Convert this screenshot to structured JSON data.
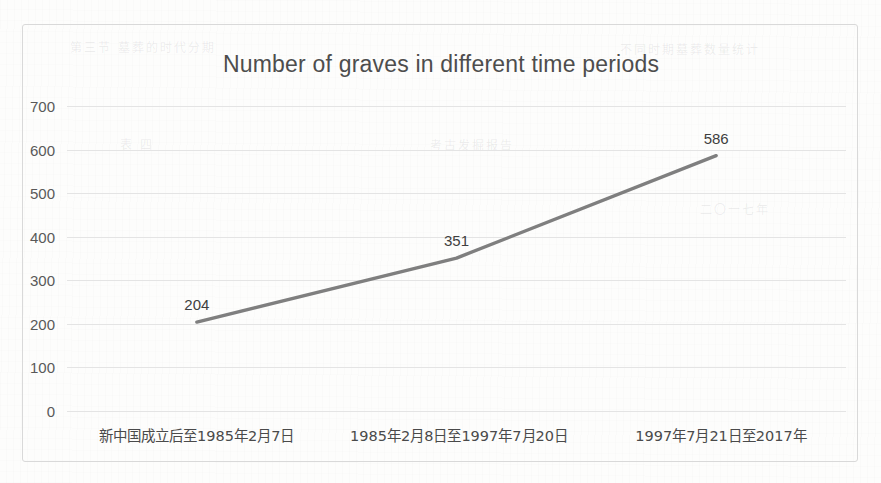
{
  "chart_data": {
    "type": "line",
    "title": "Number of graves in different time periods",
    "xlabel": "",
    "ylabel": "",
    "categories": [
      "新中国成立后至1985年2月7日",
      "1985年2月8日至1997年7月20日",
      "1997年7月21日至2017年"
    ],
    "values": [
      204,
      351,
      586
    ],
    "point_labels": [
      "204",
      "351",
      "586"
    ],
    "ylim": [
      0,
      700
    ],
    "yticks": [
      700,
      600,
      500,
      400,
      300,
      200,
      100,
      0
    ],
    "ytick_labels": [
      "700",
      "600",
      "500",
      "400",
      "300",
      "200",
      "100",
      "0"
    ],
    "grid": true,
    "legend": "none",
    "series_color": "#7f7f7f",
    "title_color": "#4d4d4d",
    "gridline_color": "#e4e4e4",
    "border_color": "#d9d9d9",
    "background_color": "#fdfdfc"
  },
  "bleed_text": [
    "第三节 墓葬的时代分期",
    "不同时期墓葬数量统计",
    "表 四",
    "考古发掘报告",
    "二〇一七年"
  ]
}
